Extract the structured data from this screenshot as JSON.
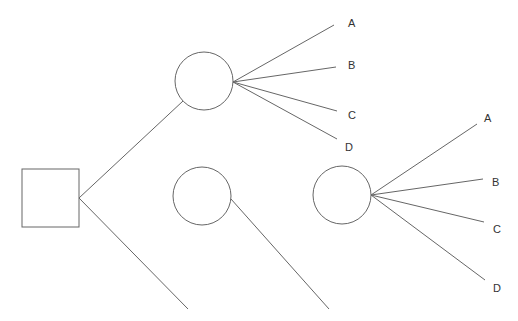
{
  "diagram": {
    "type": "decision-tree",
    "decision_node": {
      "shape": "square"
    },
    "chance_nodes": [
      {
        "id": "top",
        "branches": [
          "A",
          "B",
          "C",
          "D"
        ]
      },
      {
        "id": "middle",
        "branches": []
      },
      {
        "id": "right",
        "branches": [
          "A",
          "B",
          "C",
          "D"
        ]
      }
    ],
    "labels_top": {
      "a": "A",
      "b": "B",
      "c": "C",
      "d": "D"
    },
    "labels_right": {
      "a": "A",
      "b": "B",
      "c": "C",
      "d": "D"
    },
    "line_color": "#555555"
  }
}
